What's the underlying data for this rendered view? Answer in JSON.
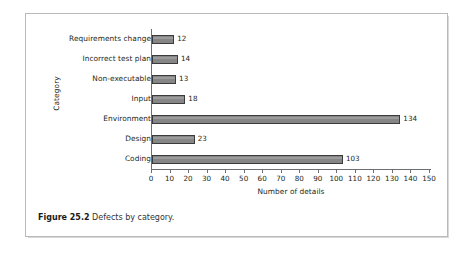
{
  "chart_data": {
    "type": "bar",
    "orientation": "horizontal",
    "title": "",
    "xlabel": "Number of details",
    "ylabel": "Category",
    "categories": [
      "Requirements change",
      "Incorrect test plan",
      "Non-executable",
      "Input",
      "Environment",
      "Design",
      "Coding"
    ],
    "values": [
      12,
      14,
      13,
      18,
      134,
      23,
      103
    ],
    "value_labels": [
      "12",
      "14",
      "13",
      "18",
      "134",
      "23",
      "103"
    ],
    "xlim": [
      0,
      150
    ],
    "xticks": [
      0,
      10,
      20,
      30,
      40,
      50,
      60,
      70,
      80,
      90,
      100,
      110,
      120,
      130,
      140,
      150
    ],
    "xtick_labels": [
      "0",
      "10",
      "20",
      "30",
      "40",
      "50",
      "60",
      "70",
      "80",
      "90",
      "100",
      "110",
      "120",
      "130",
      "140",
      "150"
    ],
    "grid": false,
    "legend": null,
    "bar_fill_color": "#868686",
    "bar_edge_color": "#3b3b3b",
    "axis_color": "#6d6e71",
    "text_color": "#231f20"
  },
  "caption": {
    "label": "Figure 25.2",
    "text": "Defects by category."
  }
}
